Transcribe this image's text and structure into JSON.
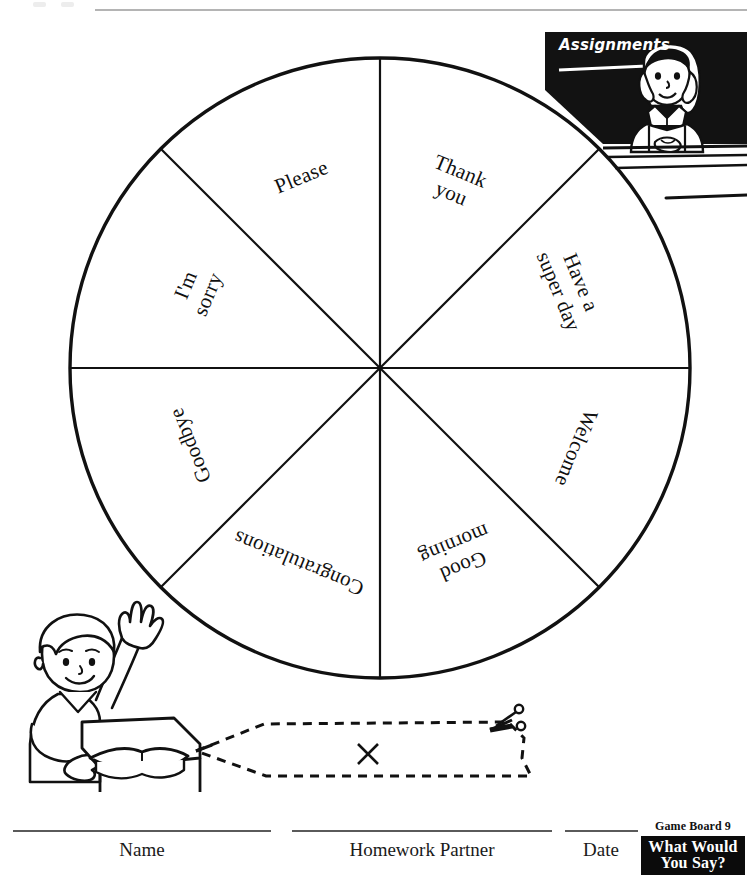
{
  "worksheet": {
    "title": "What Would You Say?",
    "board_number_label": "Game Board 9"
  },
  "blackboard": {
    "heading": "Assignments"
  },
  "wheel": {
    "segment_count": 8,
    "segments": [
      {
        "label": "Thank you",
        "lines": [
          "Thank",
          "you"
        ],
        "angle_deg": 22.5,
        "rotation_deg": 22.5,
        "radius_pct": 64
      },
      {
        "label": "Have a super day",
        "lines": [
          "Have a",
          "super day"
        ],
        "angle_deg": 67.5,
        "rotation_deg": 67.5,
        "radius_pct": 66
      },
      {
        "label": "Welcome",
        "lines": [
          "Welcome"
        ],
        "angle_deg": 112.5,
        "rotation_deg": 112.5,
        "radius_pct": 68
      },
      {
        "label": "Good morning",
        "lines": [
          "Good",
          "morning"
        ],
        "angle_deg": 157.5,
        "rotation_deg": 157.5,
        "radius_pct": 66
      },
      {
        "label": "Congratulations",
        "lines": [
          "Congratulations"
        ],
        "angle_deg": 202.5,
        "rotation_deg": 202.5,
        "radius_pct": 68
      },
      {
        "label": "Goodbye",
        "lines": [
          "Goodbye"
        ],
        "angle_deg": 247.5,
        "rotation_deg": 247.5,
        "radius_pct": 66
      },
      {
        "label": "I'm sorry",
        "lines": [
          "I'm",
          "sorry"
        ],
        "angle_deg": 292.5,
        "rotation_deg": 292.5,
        "radius_pct": 64
      },
      {
        "label": "Please",
        "lines": [
          "Please"
        ],
        "angle_deg": 337.5,
        "rotation_deg": 337.5,
        "radius_pct": 66
      }
    ]
  },
  "cutout": {
    "mark": "×",
    "scissors_icon": "scissors-icon",
    "instruction_style": "dashed-cut-line"
  },
  "footer": {
    "fields": [
      {
        "label": "Name"
      },
      {
        "label": "Homework Partner"
      },
      {
        "label": "Date"
      }
    ]
  },
  "colors": {
    "ink": "#101010",
    "rule": "#5a5a5a",
    "top_rule": "#b4b4b4",
    "badge_bg": "#0b0b0b",
    "badge_fg": "#ffffff",
    "paper": "#ffffff"
  }
}
